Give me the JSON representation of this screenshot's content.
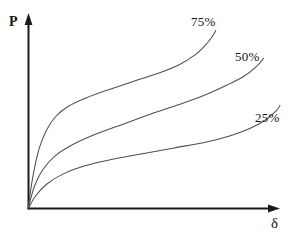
{
  "figure": {
    "background_color": "#ffffff",
    "axis_color": "#1a1a1a",
    "curve_color": "#4f4f4f",
    "text_color": "#141414"
  },
  "axes": {
    "y_label": "P",
    "x_label": "δ",
    "origin_x": 28,
    "origin_y": 209,
    "x_axis_end": 280,
    "y_axis_top": 14
  },
  "labels": {
    "series_75": "75%",
    "series_50": "50%",
    "series_25": "25%"
  },
  "chart_data": {
    "type": "line",
    "title": "",
    "xlabel": "δ",
    "ylabel": "P",
    "grid": false,
    "legend_position": "inline-end-of-curve",
    "axis_style": "arrow-axes-no-ticks",
    "xlim": [
      0,
      1
    ],
    "ylim": [
      0,
      1
    ],
    "annotations": [
      {
        "text": "75%",
        "x": 0.65,
        "y": 0.95
      },
      {
        "text": "50%",
        "x": 0.82,
        "y": 0.77
      },
      {
        "text": "25%",
        "x": 0.9,
        "y": 0.5
      }
    ],
    "series": [
      {
        "name": "75%",
        "label": "75%",
        "points": [
          {
            "x": 0.0,
            "y": 0.0
          },
          {
            "x": 0.02,
            "y": 0.18
          },
          {
            "x": 0.045,
            "y": 0.33
          },
          {
            "x": 0.075,
            "y": 0.43
          },
          {
            "x": 0.11,
            "y": 0.5
          },
          {
            "x": 0.16,
            "y": 0.555
          },
          {
            "x": 0.23,
            "y": 0.6
          },
          {
            "x": 0.32,
            "y": 0.645
          },
          {
            "x": 0.42,
            "y": 0.69
          },
          {
            "x": 0.52,
            "y": 0.735
          },
          {
            "x": 0.6,
            "y": 0.78
          },
          {
            "x": 0.66,
            "y": 0.83
          },
          {
            "x": 0.7,
            "y": 0.88
          },
          {
            "x": 0.73,
            "y": 0.93
          },
          {
            "x": 0.745,
            "y": 0.965
          }
        ]
      },
      {
        "name": "50%",
        "label": "50%",
        "points": [
          {
            "x": 0.0,
            "y": 0.0
          },
          {
            "x": 0.025,
            "y": 0.12
          },
          {
            "x": 0.06,
            "y": 0.215
          },
          {
            "x": 0.11,
            "y": 0.29
          },
          {
            "x": 0.18,
            "y": 0.35
          },
          {
            "x": 0.27,
            "y": 0.405
          },
          {
            "x": 0.38,
            "y": 0.46
          },
          {
            "x": 0.49,
            "y": 0.515
          },
          {
            "x": 0.6,
            "y": 0.565
          },
          {
            "x": 0.7,
            "y": 0.615
          },
          {
            "x": 0.79,
            "y": 0.67
          },
          {
            "x": 0.86,
            "y": 0.72
          },
          {
            "x": 0.91,
            "y": 0.775
          },
          {
            "x": 0.935,
            "y": 0.815
          }
        ]
      },
      {
        "name": "25%",
        "label": "25%",
        "points": [
          {
            "x": 0.0,
            "y": 0.0
          },
          {
            "x": 0.03,
            "y": 0.07
          },
          {
            "x": 0.075,
            "y": 0.135
          },
          {
            "x": 0.14,
            "y": 0.19
          },
          {
            "x": 0.23,
            "y": 0.235
          },
          {
            "x": 0.34,
            "y": 0.27
          },
          {
            "x": 0.46,
            "y": 0.3
          },
          {
            "x": 0.58,
            "y": 0.33
          },
          {
            "x": 0.7,
            "y": 0.36
          },
          {
            "x": 0.8,
            "y": 0.395
          },
          {
            "x": 0.88,
            "y": 0.435
          },
          {
            "x": 0.94,
            "y": 0.48
          },
          {
            "x": 0.985,
            "y": 0.53
          },
          {
            "x": 1.0,
            "y": 0.56
          }
        ]
      }
    ]
  }
}
